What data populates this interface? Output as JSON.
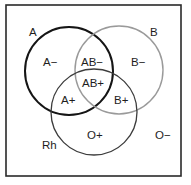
{
  "diagram": {
    "type": "venn",
    "frame": {
      "x": 6,
      "y": 5,
      "width": 175,
      "height": 171,
      "stroke": "#2a2a2a"
    },
    "sets": [
      {
        "id": "A",
        "label": "A",
        "cx": 69,
        "cy": 71,
        "r": 44,
        "stroke": "#151515",
        "stroke_width": 2.0,
        "label_x": 29,
        "label_y": 36
      },
      {
        "id": "B",
        "label": "B",
        "cx": 119,
        "cy": 70,
        "r": 44,
        "stroke": "#9a9a9a",
        "stroke_width": 1.4,
        "label_x": 150,
        "label_y": 36
      },
      {
        "id": "Rh",
        "label": "Rh",
        "cx": 94,
        "cy": 112,
        "r": 43,
        "stroke": "#3c3c3c",
        "stroke_width": 1.3,
        "label_x": 42,
        "label_y": 149
      }
    ],
    "regions": [
      {
        "id": "a-neg",
        "label": "A−",
        "x": 43,
        "y": 66
      },
      {
        "id": "ab-neg",
        "label": "AB−",
        "x": 81,
        "y": 66
      },
      {
        "id": "b-neg",
        "label": "B−",
        "x": 131,
        "y": 66
      },
      {
        "id": "ab-pos",
        "label": "AB+",
        "x": 82,
        "y": 87
      },
      {
        "id": "a-pos",
        "label": "A+",
        "x": 61,
        "y": 104
      },
      {
        "id": "b-pos",
        "label": "B+",
        "x": 114,
        "y": 104
      },
      {
        "id": "o-pos",
        "label": "O+",
        "x": 87,
        "y": 139
      },
      {
        "id": "o-neg",
        "label": "O−",
        "x": 155,
        "y": 139
      }
    ]
  }
}
